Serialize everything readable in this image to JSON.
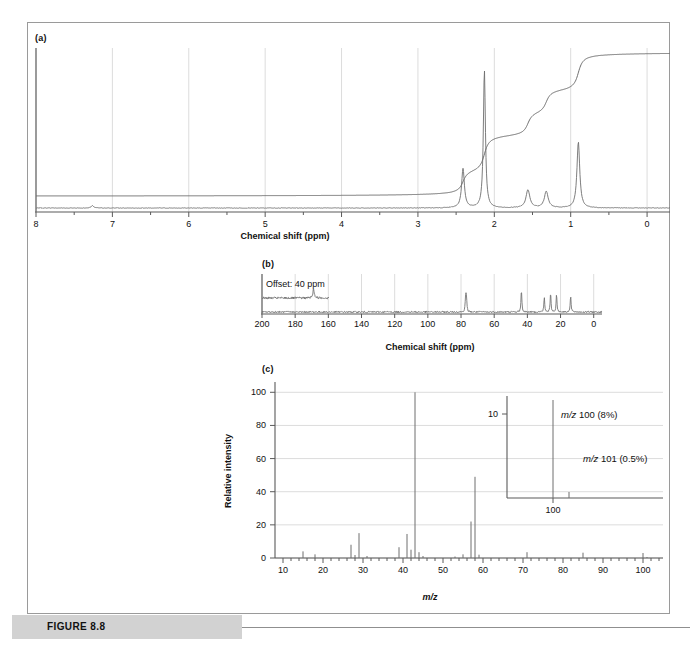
{
  "figure": {
    "label": "FIGURE 8.8"
  },
  "panel_a": {
    "tag": "(a)",
    "xlabel": "Chemical shift (ppm)"
  },
  "panel_b": {
    "tag": "(b)",
    "xlabel": "Chemical shift (ppm)",
    "offset_label": "Offset: 40 ppm"
  },
  "panel_c": {
    "tag": "(c)",
    "xlabel": "m/z",
    "ylabel": "Relative intensity",
    "inset": {
      "tick_label": "10",
      "axis_label": "100",
      "annotation_1": "m/z 100 (8%)",
      "annotation_2": "m/z 101 (0.5%)"
    }
  },
  "colors": {
    "spectrum_line": "#6e6e6e",
    "integral_line": "#6e6e6e",
    "grid": "#dcdcdc",
    "axis": "#5a5a5a",
    "banner": "#d2d2d2",
    "text": "#111111"
  },
  "chart_data": [
    {
      "type": "line",
      "name": "proton-nmr",
      "title": "(a)",
      "xlabel": "Chemical shift (ppm)",
      "ylabel": "",
      "xlim": [
        8,
        -0.3
      ],
      "grid": true,
      "tick_labels": [
        8,
        7,
        6,
        5,
        4,
        3,
        2,
        1,
        0
      ],
      "minor_tick_step": 0.5,
      "peaks": [
        {
          "shift": 7.26,
          "height": 1.5,
          "width": 0.02,
          "assignment": "CHCl3 residual"
        },
        {
          "shift": 2.41,
          "height": 26,
          "width": 0.022,
          "multiplicity": "t"
        },
        {
          "shift": 2.13,
          "height": 92,
          "width": 0.016,
          "multiplicity": "s"
        },
        {
          "shift": 1.56,
          "height": 12,
          "width": 0.03,
          "multiplicity": "m"
        },
        {
          "shift": 1.32,
          "height": 11,
          "width": 0.03,
          "multiplicity": "m"
        },
        {
          "shift": 0.9,
          "height": 44,
          "width": 0.022,
          "multiplicity": "t"
        }
      ],
      "integral_steps": [
        {
          "shift": 2.41,
          "rise": 14
        },
        {
          "shift": 2.13,
          "rise": 22
        },
        {
          "shift": 1.56,
          "rise": 14
        },
        {
          "shift": 1.32,
          "rise": 14
        },
        {
          "shift": 0.9,
          "rise": 22
        }
      ]
    },
    {
      "type": "line",
      "name": "carbon-nmr",
      "title": "(b)",
      "xlabel": "Chemical shift (ppm)",
      "ylabel": "",
      "xlim": [
        200,
        -5
      ],
      "grid": true,
      "tick_labels": [
        200,
        180,
        160,
        140,
        120,
        100,
        80,
        60,
        40,
        20,
        0
      ],
      "offset_trace": {
        "label": "Offset: 40 ppm",
        "range": [
          200,
          160
        ]
      },
      "peaks": [
        {
          "shift": 208.9,
          "height": 14,
          "assignment": "C=O (offset trace)"
        },
        {
          "shift": 77.0,
          "height": 26,
          "assignment": "CDCl3 triplet"
        },
        {
          "shift": 76.7,
          "height": 26,
          "assignment": "CDCl3 triplet"
        },
        {
          "shift": 77.3,
          "height": 26,
          "assignment": "CDCl3 triplet"
        },
        {
          "shift": 43.6,
          "height": 62
        },
        {
          "shift": 29.8,
          "height": 40
        },
        {
          "shift": 26.0,
          "height": 52
        },
        {
          "shift": 22.4,
          "height": 50
        },
        {
          "shift": 13.9,
          "height": 44
        }
      ]
    },
    {
      "type": "bar",
      "name": "mass-spectrum",
      "title": "(c)",
      "xlabel": "m/z",
      "ylabel": "Relative intensity",
      "xlim": [
        8,
        105
      ],
      "ylim": [
        0,
        105
      ],
      "grid": true,
      "x_tick_labels": [
        10,
        20,
        30,
        40,
        50,
        60,
        70,
        80,
        90,
        100
      ],
      "y_tick_labels": [
        0,
        20,
        40,
        60,
        80,
        100
      ],
      "mz": [
        15,
        18,
        27,
        28,
        29,
        31,
        39,
        41,
        42,
        43,
        44,
        45,
        53,
        55,
        57,
        58,
        59,
        71,
        85,
        100,
        101
      ],
      "intensity": [
        4.0,
        2.2,
        8.0,
        1.8,
        15.0,
        1.2,
        6.5,
        14.5,
        5.0,
        100.0,
        3.5,
        1.2,
        0.9,
        2.2,
        22.0,
        49.0,
        2.0,
        3.5,
        3.2,
        3.0,
        0.6
      ],
      "inset": {
        "x_tick_label": "100",
        "y_tick_label": "10",
        "peaks": [
          {
            "mz": 100,
            "intensity": 8,
            "label": "m/z 100 (8%)"
          },
          {
            "mz": 101,
            "intensity": 0.5,
            "label": "m/z 101 (0.5%)"
          }
        ]
      }
    }
  ]
}
